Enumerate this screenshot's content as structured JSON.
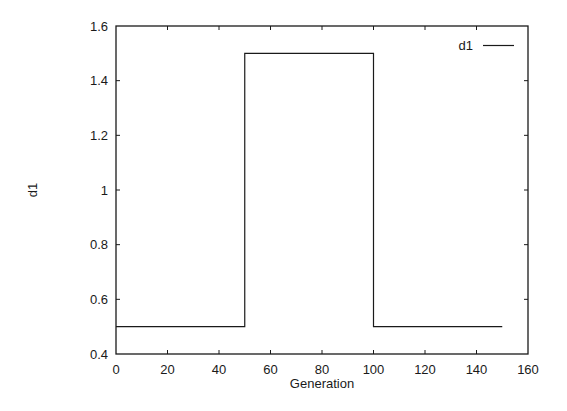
{
  "chart_data": {
    "type": "line",
    "title": "",
    "xlabel": "Generation",
    "ylabel": "d1",
    "xlim": [
      0,
      160
    ],
    "ylim": [
      0.4,
      1.6
    ],
    "x_ticks": [
      0,
      20,
      40,
      60,
      80,
      100,
      120,
      140,
      160
    ],
    "x_tick_labels": [
      "0",
      "20",
      "40",
      "60",
      "80",
      "100",
      "120",
      "140",
      "160"
    ],
    "y_ticks": [
      0.4,
      0.6,
      0.8,
      1.0,
      1.2,
      1.4,
      1.6
    ],
    "y_tick_labels": [
      "0.4",
      "0.6",
      "0.8",
      "1",
      "1.2",
      "1.4",
      "1.6"
    ],
    "grid": false,
    "legend_position": "top-right",
    "series": [
      {
        "name": "d1",
        "color": "#1a1a1a",
        "step": true,
        "x": [
          0,
          50,
          50,
          100,
          100,
          150
        ],
        "y": [
          0.5,
          0.5,
          1.5,
          1.5,
          0.5,
          0.5
        ]
      }
    ]
  },
  "legend": {
    "items": [
      {
        "label": "d1"
      }
    ]
  },
  "colors": {
    "line": "#1a1a1a",
    "frame": "#1a1a1a",
    "background": "#ffffff"
  }
}
